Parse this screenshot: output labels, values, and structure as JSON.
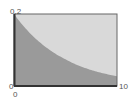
{
  "chart_data": {
    "type": "area",
    "title": "",
    "xlabel": "",
    "ylabel": "",
    "xlim": [
      0,
      10
    ],
    "ylim": [
      0,
      0.2
    ],
    "grid": false,
    "legend": null,
    "x_ticks": [
      "0",
      "10"
    ],
    "y_ticks": [
      "0",
      "0.2"
    ],
    "x": [
      0,
      1,
      2,
      3,
      4,
      5,
      6,
      7,
      8,
      9,
      10
    ],
    "series": [
      {
        "name": "area-under-curve",
        "values": [
          0.2,
          0.164,
          0.134,
          0.11,
          0.09,
          0.074,
          0.06,
          0.049,
          0.04,
          0.033,
          0.027
        ]
      }
    ],
    "colors": {
      "area_fill": "#9a9a9a",
      "background_fill": "#d9d9d9",
      "frame": "#555555"
    }
  },
  "labels": {
    "y_top": "0.2",
    "y_bottom": "0",
    "x_left": "0",
    "x_right": "10"
  }
}
